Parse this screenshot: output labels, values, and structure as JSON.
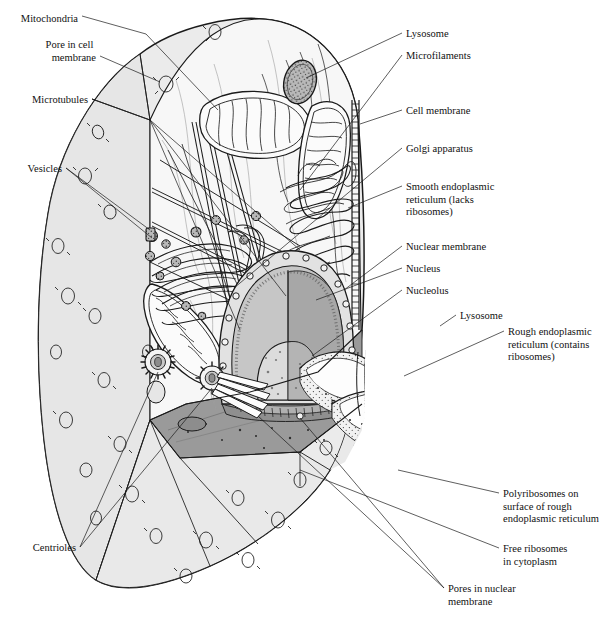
{
  "figure": {
    "type": "labeled-biological-illustration",
    "style": "pen-and-ink line drawing with grey tonal shading",
    "background_color": "#ffffff",
    "ink_color": "#1a1a1a",
    "cytoplasm_fill": "#ebebeb",
    "cut_face_fill": "#9a9a9a",
    "membrane_surface_fill": "#e4e4e4",
    "nucleoplasm_fill": "#bdbdbd"
  },
  "labels": [
    {
      "id": "mitochondria",
      "text": "Mitochondria",
      "lines": [
        "Mitochondria"
      ],
      "x": 78,
      "y": 18,
      "align": "end",
      "side": "left"
    },
    {
      "id": "pore-in-cell-membrane",
      "text": "Pore in cell membrane",
      "lines": [
        "Pore in cell",
        "membrane"
      ],
      "x": 96,
      "y": 48,
      "align": "end",
      "side": "left"
    },
    {
      "id": "microtubules",
      "text": "Microtubules",
      "lines": [
        "Microtubules"
      ],
      "x": 88,
      "y": 100,
      "align": "end",
      "side": "left"
    },
    {
      "id": "vesicles",
      "text": "Vesicles",
      "lines": [
        "Vesicles"
      ],
      "x": 62,
      "y": 170,
      "align": "end",
      "side": "left"
    },
    {
      "id": "centrioles",
      "text": "Centrioles",
      "lines": [
        "Centrioles"
      ],
      "x": 76,
      "y": 549,
      "align": "end",
      "side": "left"
    },
    {
      "id": "lysosome-top",
      "text": "Lysosome",
      "lines": [
        "Lysosome"
      ],
      "x": 406,
      "y": 35,
      "align": "start",
      "side": "right"
    },
    {
      "id": "microfilaments",
      "text": "Microfilaments",
      "lines": [
        "Microfilaments"
      ],
      "x": 406,
      "y": 57,
      "align": "start",
      "side": "right"
    },
    {
      "id": "cell-membrane",
      "text": "Cell membrane",
      "lines": [
        "Cell membrane"
      ],
      "x": 406,
      "y": 112,
      "align": "start",
      "side": "right"
    },
    {
      "id": "golgi-apparatus",
      "text": "Golgi apparatus",
      "lines": [
        "Golgi apparatus"
      ],
      "x": 406,
      "y": 150,
      "align": "start",
      "side": "right"
    },
    {
      "id": "smooth-er",
      "text": "Smooth endoplasmic reticulum (lacks ribosomes)",
      "lines": [
        "Smooth endoplasmic",
        "reticulum (lacks",
        "ribosomes)"
      ],
      "x": 406,
      "y": 188,
      "align": "start",
      "side": "right"
    },
    {
      "id": "nuclear-membrane",
      "text": "Nuclear membrane",
      "lines": [
        "Nuclear membrane"
      ],
      "x": 406,
      "y": 248,
      "align": "start",
      "side": "right"
    },
    {
      "id": "nucleus",
      "text": "Nucleus",
      "lines": [
        "Nucleus"
      ],
      "x": 406,
      "y": 271,
      "align": "start",
      "side": "right"
    },
    {
      "id": "nucleolus",
      "text": "Nucleolus",
      "lines": [
        "Nucleolus"
      ],
      "x": 406,
      "y": 292,
      "align": "start",
      "side": "right"
    },
    {
      "id": "lysosome-right",
      "text": "Lysosome",
      "lines": [
        "Lysosome"
      ],
      "x": 460,
      "y": 317,
      "align": "start",
      "side": "right"
    },
    {
      "id": "rough-er",
      "text": "Rough endoplasmic reticulum (contains ribosomes)",
      "lines": [
        "Rough endoplasmic",
        "reticulum (contains",
        "ribosomes)"
      ],
      "x": 508,
      "y": 333,
      "align": "start",
      "side": "right"
    },
    {
      "id": "polyribosomes",
      "text": "Polyribosomes on surface of rough endoplasmic reticulum",
      "lines": [
        "Polyribosomes on",
        "surface of rough",
        "endoplasmic reticulum"
      ],
      "x": 503,
      "y": 495,
      "align": "start",
      "side": "right"
    },
    {
      "id": "free-ribosomes",
      "text": "Free ribosomes in cytoplasm",
      "lines": [
        "Free ribosomes",
        "in cytoplasm"
      ],
      "x": 503,
      "y": 550,
      "align": "start",
      "side": "right"
    },
    {
      "id": "pores-nuclear",
      "text": "Pores in nuclear membrane",
      "lines": [
        "Pores in nuclear",
        "membrane"
      ],
      "x": 448,
      "y": 590,
      "align": "start",
      "side": "right"
    }
  ],
  "organelles": [
    {
      "id": "mitochondrion-1",
      "name": "Mitochondrion",
      "note": "upper-left, cristae visible"
    },
    {
      "id": "mitochondrion-2",
      "name": "Mitochondrion",
      "note": "upper-right, cristae visible"
    },
    {
      "id": "mitochondrion-3",
      "name": "Mitochondrion",
      "note": "lower-left near Golgi"
    },
    {
      "id": "lysosome-1",
      "name": "Lysosome",
      "note": "dense granular body, upper centre"
    },
    {
      "id": "lysosome-2",
      "name": "Lysosome",
      "note": "cut open at right on cut face"
    },
    {
      "id": "nucleus",
      "name": "Nucleus",
      "note": "dome, cut away, pores in membrane"
    },
    {
      "id": "nucleolus",
      "name": "Nucleolus",
      "note": "inner sphere within nucleus"
    },
    {
      "id": "golgi",
      "name": "Golgi apparatus",
      "note": "stacked flattened cisternae"
    },
    {
      "id": "smooth-er",
      "name": "Smooth endoplasmic reticulum",
      "note": "branching tubular network"
    },
    {
      "id": "rough-er",
      "name": "Rough endoplasmic reticulum",
      "note": "stippled folded cisternae"
    },
    {
      "id": "centriole-pair",
      "name": "Centrioles",
      "note": "two, one end-on, one with microtubules"
    },
    {
      "id": "microtubules",
      "name": "Microtubules",
      "note": "long straight fibres"
    },
    {
      "id": "microfilaments",
      "name": "Microfilaments",
      "note": "fine wavy fibres"
    },
    {
      "id": "vesicles",
      "name": "Vesicles",
      "note": "small dark round bodies"
    }
  ]
}
